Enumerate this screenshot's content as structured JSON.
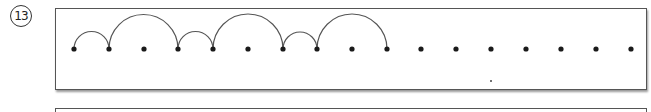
{
  "problem": {
    "number_label": "13"
  },
  "number_line": {
    "dot_y": 49,
    "dot_x": [
      74,
      109,
      144,
      178,
      213,
      248,
      283,
      317,
      352,
      387,
      421,
      456,
      491,
      526,
      561,
      596,
      631
    ],
    "jumps": [
      {
        "from": 0,
        "to": 1
      },
      {
        "from": 1,
        "to": 3
      },
      {
        "from": 3,
        "to": 4
      },
      {
        "from": 4,
        "to": 6
      },
      {
        "from": 6,
        "to": 7
      },
      {
        "from": 7,
        "to": 9
      }
    ],
    "stray_mark": {
      "x": 491,
      "y": 81
    },
    "colors": {
      "dot": "#1a1a1a",
      "arc": "#555555"
    }
  }
}
